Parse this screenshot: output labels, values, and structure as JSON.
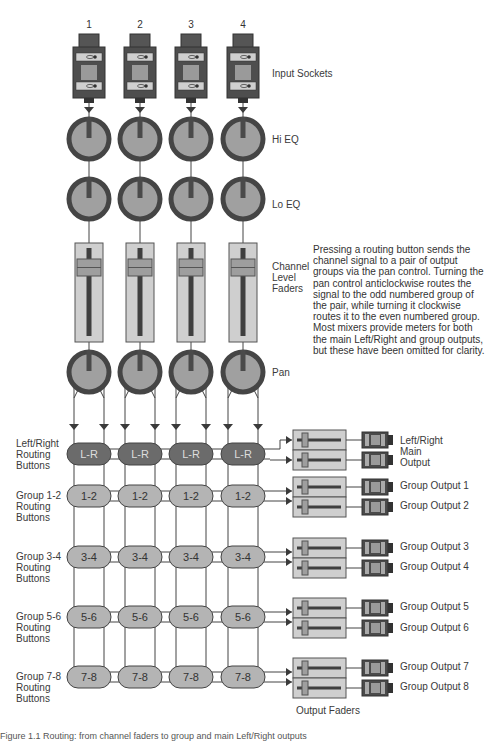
{
  "diagram": {
    "colors": {
      "dark": "#3a3a3a",
      "mid": "#8c8c8c",
      "light": "#cfcfcf",
      "knob_ring": "#454545",
      "knob_face": "#a0a0a0",
      "lr_button": "#6b6b6b",
      "group_button": "#b4b4b4",
      "line": "#444444"
    },
    "channels": [
      {
        "number": "1",
        "x": 89
      },
      {
        "number": "2",
        "x": 140
      },
      {
        "number": "3",
        "x": 191
      },
      {
        "number": "4",
        "x": 243
      }
    ],
    "stage_labels": {
      "input_sockets": "Input Sockets",
      "hi_eq": "Hi EQ",
      "lo_eq": "Lo EQ",
      "channel_faders": "Channel\nLevel\nFaders",
      "pan": "Pan"
    },
    "description": "Pressing a routing button sends the channel signal to a pair of output groups via the pan control. Turning the pan control anticlockwise routes the signal to the odd numbered group of the pair, while turning it clockwise routes it to the even numbered group. Most mixers provide meters for both the main Left/Right and group outputs, but these have been omitted for clarity.",
    "routing_rows": [
      {
        "button": "L-R",
        "label": "Left/Right\nRouting\nButtons",
        "y": 454,
        "style": "dark",
        "outputs": [
          "Left/Right\nMain\nOutput"
        ]
      },
      {
        "button": "1-2",
        "label": "Group 1-2\nRouting\nButtons",
        "y": 496,
        "style": "light",
        "outputs": [
          "Group Output 1",
          "Group Output 2"
        ]
      },
      {
        "button": "3-4",
        "label": "Group 3-4\nRouting\nButtons",
        "y": 557,
        "style": "light",
        "outputs": [
          "Group Output 3",
          "Group Output 4"
        ]
      },
      {
        "button": "5-6",
        "label": "Group 5-6\nRouting\nButtons",
        "y": 617,
        "style": "light",
        "outputs": [
          "Group Output 5",
          "Group Output 6"
        ]
      },
      {
        "button": "7-8",
        "label": "Group 7-8\nRouting\nButtons",
        "y": 677,
        "style": "light",
        "outputs": [
          "Group Output 7",
          "Group Output 8"
        ]
      }
    ],
    "output_faders_label": "Output Faders",
    "caption": "Figure 1.1 Routing: from channel faders to group and main Left/Right outputs"
  }
}
